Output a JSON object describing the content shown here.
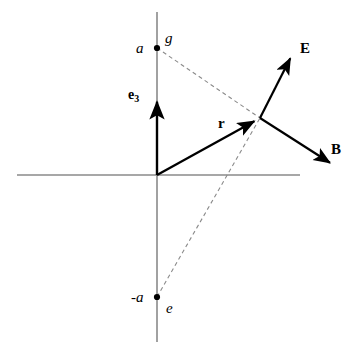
{
  "figure": {
    "type": "vector-diagram",
    "background_color": "#ffffff",
    "axis_color": "#808080",
    "vector_color": "#000000",
    "dash_color": "#888888"
  },
  "axes": {
    "origin": {
      "x": 157,
      "y": 175
    },
    "vertical": {
      "x": 157,
      "y_top": 12,
      "y_bottom": 342
    },
    "horizontal": {
      "y": 175,
      "x_left": 17,
      "x_right": 300
    }
  },
  "points": [
    {
      "name": "charge-g",
      "label": "a",
      "secondary_label": "g",
      "x": 157,
      "y": 48,
      "label_x": 136,
      "label_y": 41,
      "secondary_label_x": 165,
      "secondary_label_y": 31
    },
    {
      "name": "charge-e",
      "label": "-a",
      "secondary_label": "e",
      "x": 157,
      "y": 297,
      "label_x": 131,
      "label_y": 290,
      "secondary_label_x": 166,
      "secondary_label_y": 301
    }
  ],
  "field_point": {
    "x": 260,
    "y": 118
  },
  "vectors": [
    {
      "name": "position-vector-r",
      "label": "r",
      "from": {
        "x": 157,
        "y": 175
      },
      "to": {
        "x": 260,
        "y": 118
      },
      "label_x": 218,
      "label_y": 116
    },
    {
      "name": "electric-field-vector-E",
      "label": "E",
      "from": {
        "x": 260,
        "y": 118
      },
      "to": {
        "x": 293,
        "y": 53
      },
      "label_x": 300,
      "label_y": 41
    },
    {
      "name": "magnetic-field-vector-B",
      "label": "B",
      "from": {
        "x": 260,
        "y": 118
      },
      "to": {
        "x": 335,
        "y": 166
      },
      "label_x": 331,
      "label_y": 142
    },
    {
      "name": "unit-vector-e3",
      "label": "e",
      "subscript": "3",
      "from": {
        "x": 157,
        "y": 175
      },
      "to": {
        "x": 157,
        "y": 95
      },
      "label_x": 128,
      "label_y": 88
    }
  ],
  "dashed_lines": [
    {
      "name": "dashed-line-from-g",
      "from": {
        "x": 157,
        "y": 48
      },
      "to": {
        "x": 260,
        "y": 118
      }
    },
    {
      "name": "dashed-line-from-e",
      "from": {
        "x": 157,
        "y": 297
      },
      "to": {
        "x": 260,
        "y": 118
      }
    }
  ]
}
